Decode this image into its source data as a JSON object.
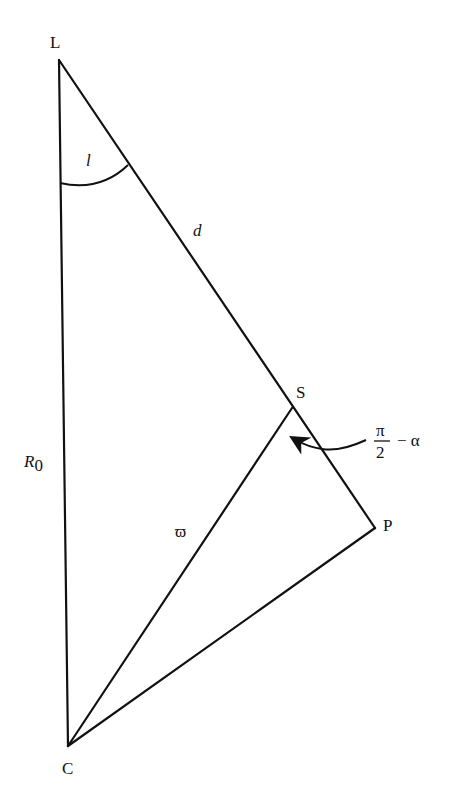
{
  "diagram": {
    "type": "geometric-triangle",
    "stroke_color": "#111111",
    "background": "#ffffff",
    "points": {
      "L": {
        "label": "L",
        "x": 59,
        "y": 60
      },
      "S": {
        "label": "S",
        "x": 292,
        "y": 408
      },
      "P": {
        "label": "P",
        "x": 375,
        "y": 528
      },
      "C": {
        "label": "C",
        "x": 68,
        "y": 746
      }
    },
    "segments": [
      {
        "from": "L",
        "to": "P",
        "label": "d"
      },
      {
        "from": "L",
        "to": "C",
        "label": "R0"
      },
      {
        "from": "S",
        "to": "C",
        "label": "ϖ"
      },
      {
        "from": "P",
        "to": "C",
        "label": ""
      }
    ],
    "labels": {
      "L": "L",
      "S": "S",
      "P": "P",
      "C": "C",
      "angle_l": "l",
      "d": "d",
      "R": "R",
      "R_sub": "0",
      "varpi": "ϖ",
      "pi": "π",
      "two": "2",
      "minus_alpha": "− α"
    },
    "angles": [
      {
        "vertex": "L",
        "label": "l"
      },
      {
        "vertex": "S",
        "label": "π/2 − α",
        "indicator": "curved-arrow"
      }
    ]
  }
}
